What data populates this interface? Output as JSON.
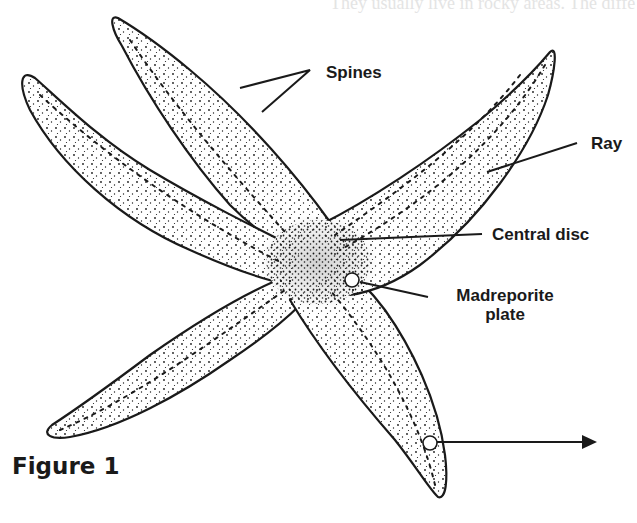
{
  "figure": {
    "caption": "Figure 1",
    "bleed_through_text": "They usually live in rocky areas. The diffe"
  },
  "labels": {
    "spines": "Spines",
    "ray": "Ray",
    "central_disc": "Central disc",
    "madreporite_line1": "Madreporite",
    "madreporite_line2": "plate"
  },
  "colors": {
    "ink": "#1a1a1a",
    "background": "#ffffff"
  }
}
